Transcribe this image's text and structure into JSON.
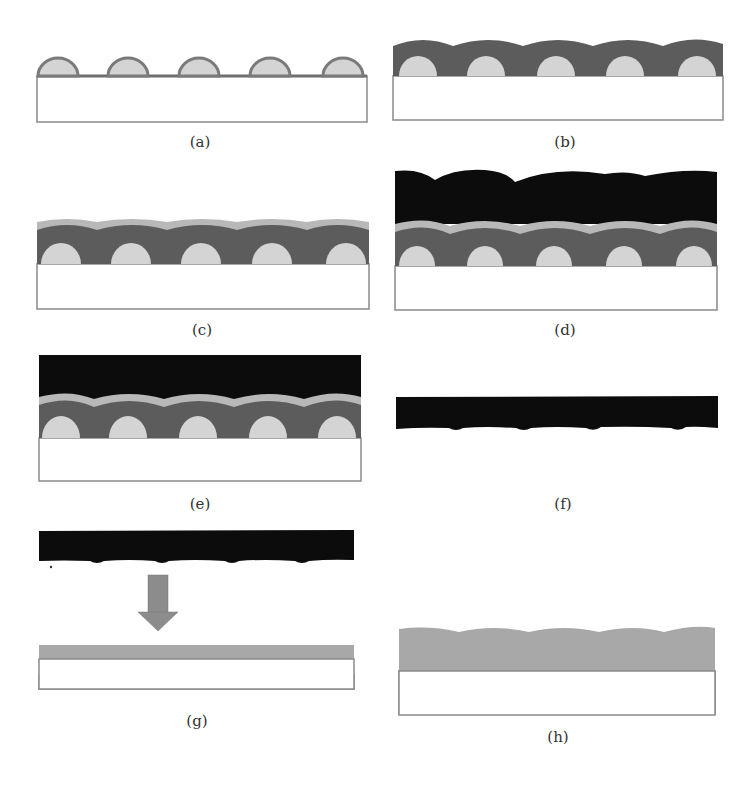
{
  "figure": {
    "colors": {
      "substrate_fill": "#ffffff",
      "substrate_border": "#8a8a8a",
      "sphere_fill": "#d4d4d4",
      "sphere_outline": "#7a7a7a",
      "shell_layer": "#5c5c5c",
      "light_layer": "#b8b8b8",
      "black_layer": "#0c0c0c",
      "arrow": "#8c8c8c",
      "final_layer": "#a8a8a8"
    },
    "panels": [
      {
        "id": "a",
        "label": "(a)",
        "content": "spheres on substrate"
      },
      {
        "id": "b",
        "label": "(b)",
        "content": "dark shell coating over spheres"
      },
      {
        "id": "c",
        "label": "(c)",
        "content": "light gray layer over dark shell"
      },
      {
        "id": "d",
        "label": "(d)",
        "content": "thick black layer deposited on top"
      },
      {
        "id": "e",
        "label": "(e)",
        "content": "black layer planarized"
      },
      {
        "id": "f",
        "label": "(f)",
        "content": "detached black film with bumps"
      },
      {
        "id": "g",
        "label": "(g)",
        "content": "black film transferred via arrow onto gray layer"
      },
      {
        "id": "h",
        "label": "(h)",
        "content": "final textured gray layer on substrate"
      }
    ]
  }
}
